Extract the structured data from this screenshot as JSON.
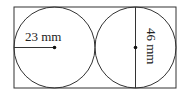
{
  "diagram": {
    "radius_label": "23 mm",
    "diameter_label": "46 mm",
    "colors": {
      "stroke": "#333333",
      "background": "#ffffff"
    }
  }
}
